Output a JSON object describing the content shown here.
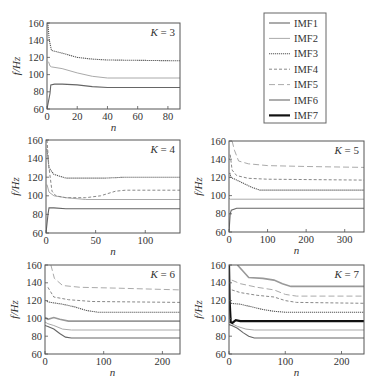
{
  "figure": {
    "legend": {
      "entries": [
        {
          "label": "IMF1",
          "color": "#666666",
          "width": 1.1,
          "dash": ""
        },
        {
          "label": "IMF2",
          "color": "#aaaaaa",
          "width": 1.0,
          "dash": ""
        },
        {
          "label": "IMF3",
          "color": "#555555",
          "width": 1.1,
          "dash": "1.2,0.8"
        },
        {
          "label": "IMF4",
          "color": "#888888",
          "width": 1.0,
          "dash": "3,2"
        },
        {
          "label": "IMF5",
          "color": "#aaaaaa",
          "width": 1.0,
          "dash": "6,3"
        },
        {
          "label": "IMF6",
          "color": "#999999",
          "width": 1.6,
          "dash": ""
        },
        {
          "label": "IMF7",
          "color": "#111111",
          "width": 2.2,
          "dash": ""
        }
      ]
    },
    "y_axis_label": "f/Hz",
    "x_axis_label": "n"
  },
  "chart_data": [
    {
      "type": "line",
      "title": "K = 3",
      "xlabel": "n",
      "ylabel": "f/Hz",
      "xlim": [
        0,
        88
      ],
      "ylim": [
        60,
        160
      ],
      "xticks": [
        0,
        20,
        40,
        60,
        80
      ],
      "yticks": [
        60,
        80,
        100,
        120,
        140,
        160
      ],
      "panel": {
        "x0": 47,
        "x1": 180,
        "y0": 23,
        "y1": 109
      },
      "series": [
        {
          "name": "IMF1",
          "x": [
            0,
            2,
            2.5,
            5,
            10,
            20,
            30,
            40,
            88
          ],
          "y": [
            60,
            78,
            88,
            89,
            89,
            88,
            86,
            85,
            85
          ]
        },
        {
          "name": "IMF2",
          "x": [
            1,
            2,
            3,
            10,
            20,
            30,
            40,
            88
          ],
          "y": [
            115,
            110,
            109,
            107,
            102,
            98,
            96,
            96
          ]
        },
        {
          "name": "IMF3",
          "x": [
            0.5,
            1.5,
            3,
            10,
            20,
            30,
            40,
            88
          ],
          "y": [
            160,
            140,
            128,
            125,
            120,
            118,
            117,
            116
          ]
        }
      ]
    },
    {
      "type": "line",
      "title": "K = 4",
      "xlabel": "n",
      "ylabel": "f/Hz",
      "xlim": [
        0,
        135
      ],
      "ylim": [
        60,
        160
      ],
      "xticks": [
        0,
        50,
        100
      ],
      "yticks": [
        60,
        80,
        100,
        120,
        140,
        160
      ],
      "panel": {
        "x0": 46,
        "x1": 180,
        "y0": 140,
        "y1": 233
      },
      "series": [
        {
          "name": "IMF1",
          "x": [
            0,
            2,
            3,
            8,
            20,
            135
          ],
          "y": [
            60,
            80,
            87,
            87,
            86,
            86
          ]
        },
        {
          "name": "IMF2",
          "x": [
            1,
            3,
            8,
            20,
            40,
            135
          ],
          "y": [
            112,
            104,
            100,
            98,
            96,
            96
          ]
        },
        {
          "name": "IMF3",
          "x": [
            1,
            3,
            8,
            20,
            40,
            60,
            80,
            135
          ],
          "y": [
            150,
            130,
            123,
            119,
            119,
            119,
            120,
            120
          ]
        },
        {
          "name": "IMF4",
          "x": [
            1,
            3,
            6,
            10,
            20,
            40,
            55,
            70,
            80,
            135
          ],
          "y": [
            160,
            130,
            105,
            100,
            98,
            98,
            100,
            105,
            106,
            106
          ]
        }
      ]
    },
    {
      "type": "line",
      "title": "K = 5",
      "xlabel": "n",
      "ylabel": "f/Hz",
      "xlim": [
        0,
        350
      ],
      "ylim": [
        60,
        160
      ],
      "xticks": [
        0,
        100,
        200,
        300
      ],
      "yticks": [
        60,
        80,
        100,
        120,
        140,
        160
      ],
      "panel": {
        "x0": 229,
        "x1": 364,
        "y0": 141,
        "y1": 232
      },
      "series": [
        {
          "name": "IMF1",
          "x": [
            0,
            3,
            6,
            20,
            60,
            350
          ],
          "y": [
            60,
            80,
            84,
            86,
            86,
            86
          ]
        },
        {
          "name": "IMF2",
          "x": [
            0,
            3,
            350
          ],
          "y": [
            97,
            96,
            96
          ]
        },
        {
          "name": "IMF3",
          "x": [
            2,
            5,
            20,
            40,
            60,
            80,
            350
          ],
          "y": [
            125,
            120,
            117,
            113,
            109,
            106,
            106
          ]
        },
        {
          "name": "IMF4",
          "x": [
            3,
            8,
            20,
            50,
            100,
            350
          ],
          "y": [
            145,
            128,
            122,
            119,
            118,
            117
          ]
        },
        {
          "name": "IMF5",
          "x": [
            8,
            14,
            25,
            50,
            100,
            200,
            350
          ],
          "y": [
            160,
            150,
            138,
            135,
            133,
            132,
            131
          ]
        }
      ]
    },
    {
      "type": "line",
      "title": "K = 6",
      "xlabel": "n",
      "ylabel": "f/Hz",
      "xlim": [
        0,
        230
      ],
      "ylim": [
        60,
        160
      ],
      "xticks": [
        0,
        100,
        200
      ],
      "yticks": [
        60,
        80,
        100,
        120,
        140,
        160
      ],
      "panel": {
        "x0": 45,
        "x1": 180,
        "y0": 265,
        "y1": 354
      },
      "series": [
        {
          "name": "IMF1",
          "x": [
            0,
            5,
            15,
            25,
            35,
            45,
            230
          ],
          "y": [
            92,
            91,
            88,
            83,
            79,
            78,
            78
          ]
        },
        {
          "name": "IMF2",
          "x": [
            0,
            5,
            15,
            30,
            45,
            230
          ],
          "y": [
            96,
            94,
            92,
            88,
            87,
            87
          ]
        },
        {
          "name": "IMF3",
          "x": [
            3,
            10,
            30,
            50,
            70,
            90,
            230
          ],
          "y": [
            119,
            118,
            116,
            113,
            109,
            107,
            107
          ]
        },
        {
          "name": "IMF4",
          "x": [
            5,
            15,
            40,
            80,
            230
          ],
          "y": [
            135,
            124,
            121,
            119,
            118
          ]
        },
        {
          "name": "IMF5",
          "x": [
            10,
            16,
            30,
            60,
            120,
            230
          ],
          "y": [
            160,
            145,
            137,
            135,
            134,
            132
          ]
        },
        {
          "name": "IMF6",
          "x": [
            0,
            5,
            15,
            25,
            40,
            230
          ],
          "y": [
            101,
            99,
            101,
            99,
            97,
            97
          ]
        }
      ]
    },
    {
      "type": "line",
      "title": "K = 7",
      "xlabel": "n",
      "ylabel": "f/Hz",
      "xlim": [
        0,
        240
      ],
      "ylim": [
        60,
        160
      ],
      "xticks": [
        0,
        100,
        200
      ],
      "yticks": [
        60,
        80,
        100,
        120,
        140,
        160
      ],
      "panel": {
        "x0": 229,
        "x1": 364,
        "y0": 265,
        "y1": 354
      },
      "series": [
        {
          "name": "IMF1",
          "x": [
            0,
            5,
            15,
            25,
            35,
            45,
            240
          ],
          "y": [
            93,
            92,
            89,
            84,
            80,
            78,
            78
          ]
        },
        {
          "name": "IMF2",
          "x": [
            0,
            5,
            15,
            30,
            45,
            240
          ],
          "y": [
            96,
            94,
            91,
            88,
            87,
            87
          ]
        },
        {
          "name": "IMF3",
          "x": [
            3,
            20,
            40,
            60,
            80,
            100,
            240
          ],
          "y": [
            117,
            116,
            113,
            110,
            108,
            107,
            107
          ]
        },
        {
          "name": "IMF4",
          "x": [
            5,
            20,
            50,
            80,
            100,
            120,
            240
          ],
          "y": [
            132,
            129,
            126,
            124,
            120,
            118,
            117
          ]
        },
        {
          "name": "IMF5",
          "x": [
            5,
            20,
            50,
            80,
            100,
            120,
            240
          ],
          "y": [
            143,
            139,
            135,
            132,
            127,
            125,
            125
          ]
        },
        {
          "name": "IMF6",
          "x": [
            15,
            25,
            35,
            60,
            80,
            95,
            110,
            240
          ],
          "y": [
            160,
            153,
            146,
            145,
            143,
            139,
            136,
            136
          ]
        },
        {
          "name": "IMF7",
          "x": [
            0,
            1,
            3,
            6,
            12,
            20,
            240
          ],
          "y": [
            160,
            120,
            96,
            95,
            98,
            97,
            97
          ]
        }
      ]
    }
  ]
}
